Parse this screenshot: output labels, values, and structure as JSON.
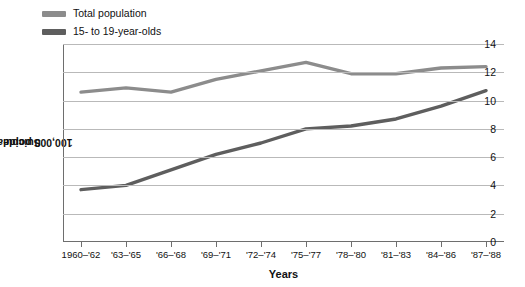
{
  "chart_data": {
    "type": "line",
    "title": "",
    "xlabel": "Years",
    "ylabel": "Suicide rate per 100,000 population",
    "categories": [
      "1960–'62",
      "'63–'65",
      "'66–'68",
      "'69–'71",
      "'72–'74",
      "'75–'77",
      "'78–'80",
      "'81–'83",
      "'84–'86",
      "'87–'88"
    ],
    "ylim": [
      0,
      14
    ],
    "yticks": [
      0,
      2,
      4,
      6,
      8,
      10,
      12,
      14
    ],
    "grid": true,
    "legend_position": "top-left",
    "series": [
      {
        "name": "Total population",
        "color": "#8c8c8c",
        "values": [
          10.6,
          10.9,
          10.6,
          11.5,
          12.1,
          12.7,
          11.9,
          11.9,
          12.3,
          12.4
        ]
      },
      {
        "name": "15- to 19-year-olds",
        "color": "#5e5e5e",
        "values": [
          3.7,
          4.0,
          5.1,
          6.2,
          7.0,
          8.0,
          8.2,
          8.7,
          9.6,
          10.7
        ]
      }
    ]
  },
  "legend": {
    "items": [
      {
        "label": "Total population",
        "color": "#8c8c8c"
      },
      {
        "label": "15- to 19-year-olds",
        "color": "#5e5e5e"
      }
    ]
  },
  "axes": {
    "x_title": "Years",
    "y_title_line1": "Suicide rate per",
    "y_title_line2": "100,000 population"
  }
}
